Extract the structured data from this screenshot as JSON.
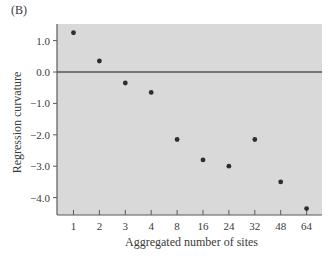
{
  "panel_label": "(B)",
  "chart_data": {
    "type": "scatter",
    "title": "",
    "xlabel": "Aggregated number of sites",
    "ylabel": "Regression curvature",
    "categories": [
      "1",
      "2",
      "3",
      "4",
      "8",
      "16",
      "24",
      "32",
      "48",
      "64"
    ],
    "values": [
      1.25,
      0.35,
      -0.35,
      -0.65,
      -2.15,
      -2.8,
      -3.0,
      -2.15,
      -3.5,
      -4.35
    ],
    "yticks": [
      1.0,
      0.0,
      -1.0,
      -2.0,
      -3.0,
      -4.0
    ],
    "ytick_labels": [
      "1.0",
      "0.0",
      "−1.0",
      "−2.0",
      "−3.0",
      "−4.0"
    ],
    "ylim": [
      -4.5,
      1.5
    ],
    "x_scale": "categorical",
    "reference_line": {
      "y": 0.0
    },
    "grid": false,
    "legend": null,
    "colors": {
      "plot_background": "#d9d9d9",
      "points": "#2e2e2e",
      "axis": "#5a5a5a",
      "zero_line": "#555555"
    }
  }
}
